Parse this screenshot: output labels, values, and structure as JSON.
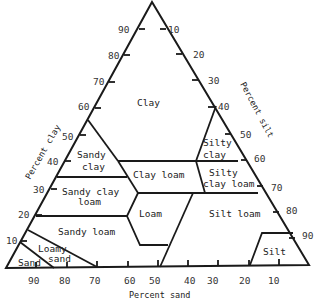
{
  "diagram": {
    "axes": {
      "clay": {
        "label": "Percent clay",
        "ticks": [
          "90",
          "80",
          "70",
          "60",
          "50",
          "40",
          "30",
          "20",
          "10"
        ]
      },
      "silt": {
        "label": "Percent silt",
        "ticks": [
          "10",
          "20",
          "30",
          "40",
          "50",
          "60",
          "70",
          "80",
          "90"
        ]
      },
      "sand": {
        "label": "Percent sand",
        "ticks": [
          "90",
          "80",
          "70",
          "60",
          "50",
          "40",
          "30",
          "20",
          "10"
        ]
      }
    },
    "regions": {
      "clay": "Clay",
      "sandy_clay_1": "Sandy",
      "sandy_clay_2": "clay",
      "silty_clay_1": "Silty",
      "silty_clay_2": "clay",
      "clay_loam": "Clay loam",
      "silty_clay_loam_1": "Silty",
      "silty_clay_loam_2": "clay loam",
      "sandy_clay_loam_1": "Sandy clay",
      "sandy_clay_loam_2": "loam",
      "loam": "Loam",
      "silt_loam": "Silt loam",
      "sandy_loam": "Sandy loam",
      "loamy_sand_1": "Loamy",
      "loamy_sand_2": "sand",
      "sand": "Sand",
      "silt": "Silt"
    }
  }
}
